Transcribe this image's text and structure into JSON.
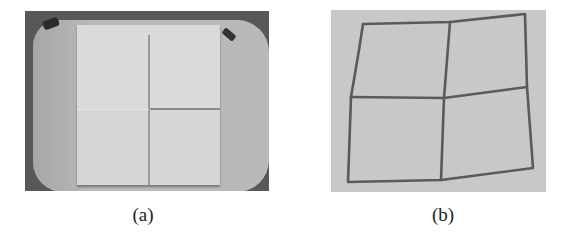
{
  "figure": {
    "panels": [
      {
        "id": "a",
        "label": "(a)",
        "description": "Grayscale photo of a square cloth sample folded into four quadrants lying on a rounded tray, with two dark clips at the top corners"
      },
      {
        "id": "b",
        "label": "(b)",
        "description": "Grayscale photo of a distorted square grid of four quadrants drawn with dark lines on a textured fabric surface"
      }
    ],
    "colors": {
      "background": "#ffffff",
      "tray": "#b9b9b9",
      "cloth": "#d6d6d6",
      "fabric_b": "#c8c8c8",
      "grid_line": "#5a5a5a"
    }
  }
}
